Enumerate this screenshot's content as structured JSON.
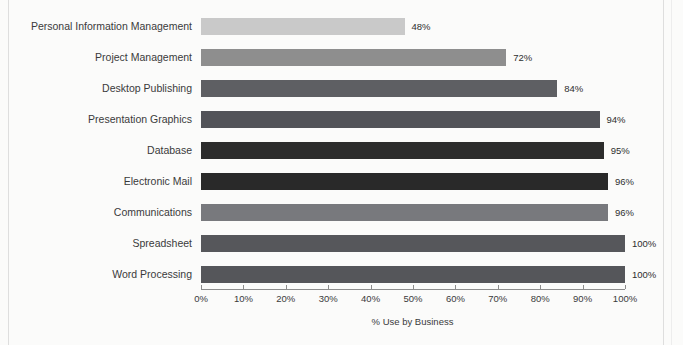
{
  "figure": {
    "background_color": "#fbfbfa",
    "plot_left_px": 201,
    "plot_width_px": 424
  },
  "chart_data": {
    "type": "bar",
    "orientation": "horizontal",
    "title": "",
    "subtitle": "",
    "xlabel": "% Use by Business",
    "ylabel": "",
    "xlim": [
      0,
      100
    ],
    "grid": false,
    "legend": "none",
    "value_suffix": "%",
    "categories": [
      "Personal Information Management",
      "Project Management",
      "Desktop Publishing",
      "Presentation Graphics",
      "Database",
      "Electronic Mail",
      "Communications",
      "Spreadsheet",
      "Word Processing"
    ],
    "values": [
      48,
      72,
      84,
      94,
      95,
      96,
      96,
      100,
      100
    ],
    "value_labels": [
      "48%",
      "72%",
      "84%",
      "94%",
      "95%",
      "96%",
      "96%",
      "100%",
      "100%"
    ],
    "bar_colors": [
      "#c9c9c9",
      "#8e8e8e",
      "#5e5f63",
      "#525358",
      "#2c2c2c",
      "#292929",
      "#78797d",
      "#56575b",
      "#55565a"
    ],
    "xticks": [
      0,
      10,
      20,
      30,
      40,
      50,
      60,
      70,
      80,
      90,
      100
    ],
    "xtick_labels": [
      "0%",
      "10%",
      "20%",
      "30%",
      "40%",
      "50%",
      "60%",
      "70%",
      "80%",
      "90%",
      "100%"
    ],
    "axis_color": "#8d8d8d",
    "text_color": "#3a3a3a"
  }
}
